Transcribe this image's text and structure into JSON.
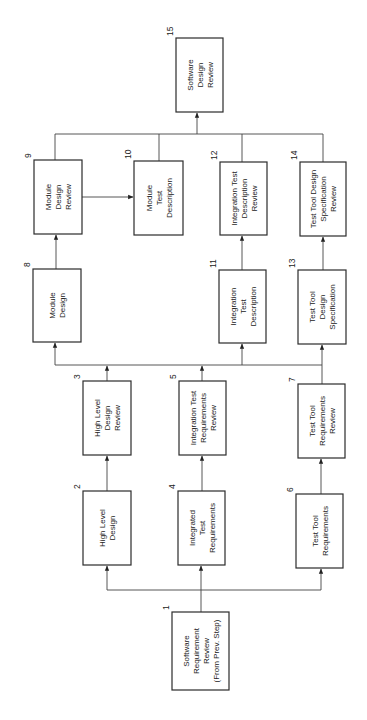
{
  "diagram": {
    "orientation": "rotated 90 degrees counter-clockwise",
    "nodes": [
      {
        "id": "1",
        "num": "1",
        "lines": [
          "Software",
          "Requirement",
          "Review",
          "(From Prev. Step)"
        ],
        "x": 172,
        "y": 612,
        "w": 57,
        "h": 78
      },
      {
        "id": "2",
        "num": "2",
        "lines": [
          "High Level",
          "Design"
        ],
        "x": 83,
        "y": 491,
        "w": 48,
        "h": 74
      },
      {
        "id": "3",
        "num": "3",
        "lines": [
          "High Level",
          "Design",
          "Review"
        ],
        "x": 83,
        "y": 381,
        "w": 48,
        "h": 74
      },
      {
        "id": "4",
        "num": "4",
        "lines": [
          "Integrated",
          "Test",
          "Requirements"
        ],
        "x": 178,
        "y": 491,
        "w": 47,
        "h": 74
      },
      {
        "id": "5",
        "num": "5",
        "lines": [
          "Integration Test",
          "Requirements",
          "Review"
        ],
        "x": 179,
        "y": 381,
        "w": 47,
        "h": 74
      },
      {
        "id": "6",
        "num": "6",
        "lines": [
          "Test Tool",
          "Requirements"
        ],
        "x": 296,
        "y": 494,
        "w": 47,
        "h": 74
      },
      {
        "id": "7",
        "num": "7",
        "lines": [
          "Test Tool",
          "Requirements",
          "Review"
        ],
        "x": 298,
        "y": 384,
        "w": 47,
        "h": 74
      },
      {
        "id": "8",
        "num": "8",
        "lines": [
          "Module",
          "Design"
        ],
        "x": 33,
        "y": 269,
        "w": 48,
        "h": 73
      },
      {
        "id": "9",
        "num": "9",
        "lines": [
          "Module",
          "Design",
          "Review"
        ],
        "x": 34,
        "y": 160,
        "w": 48,
        "h": 74
      },
      {
        "id": "10",
        "num": "10",
        "lines": [
          "Module",
          "Test",
          "Description"
        ],
        "x": 134,
        "y": 161,
        "w": 49,
        "h": 74
      },
      {
        "id": "11",
        "num": "11",
        "lines": [
          "Integration",
          "Test",
          "Description"
        ],
        "x": 219,
        "y": 270,
        "w": 47,
        "h": 73
      },
      {
        "id": "12",
        "num": "12",
        "lines": [
          "Integration Test",
          "Description",
          "Review"
        ],
        "x": 220,
        "y": 162,
        "w": 47,
        "h": 73
      },
      {
        "id": "13",
        "num": "13",
        "lines": [
          "Test Tool",
          "Design",
          "Specification"
        ],
        "x": 298,
        "y": 270,
        "w": 48,
        "h": 74
      },
      {
        "id": "14",
        "num": "14",
        "lines": [
          "Test Tool Design",
          "Specification",
          "Review"
        ],
        "x": 300,
        "y": 162,
        "w": 46,
        "h": 74
      },
      {
        "id": "15",
        "num": "15",
        "lines": [
          "Software",
          "Design",
          "Review"
        ],
        "x": 176,
        "y": 38,
        "w": 47,
        "h": 74
      }
    ],
    "edges": [
      {
        "from": "1",
        "to": "2"
      },
      {
        "from": "1",
        "to": "4"
      },
      {
        "from": "1",
        "to": "6"
      },
      {
        "from": "2",
        "to": "3"
      },
      {
        "from": "4",
        "to": "5"
      },
      {
        "from": "6",
        "to": "7"
      },
      {
        "from": "3",
        "to": "8"
      },
      {
        "from": "3",
        "to": "11"
      },
      {
        "from": "3",
        "to": "13"
      },
      {
        "from": "5",
        "to": "8"
      },
      {
        "from": "5",
        "to": "11"
      },
      {
        "from": "5",
        "to": "13"
      },
      {
        "from": "7",
        "to": "8"
      },
      {
        "from": "7",
        "to": "11"
      },
      {
        "from": "7",
        "to": "13"
      },
      {
        "from": "8",
        "to": "9"
      },
      {
        "from": "9",
        "to": "10"
      },
      {
        "from": "11",
        "to": "12"
      },
      {
        "from": "13",
        "to": "14"
      },
      {
        "from": "9",
        "to": "15"
      },
      {
        "from": "10",
        "to": "15"
      },
      {
        "from": "12",
        "to": "15"
      },
      {
        "from": "14",
        "to": "15"
      }
    ],
    "colors": {
      "line": "#444444",
      "box_border": "#2b2b2b",
      "text": "#222222",
      "background": "#ffffff"
    }
  }
}
